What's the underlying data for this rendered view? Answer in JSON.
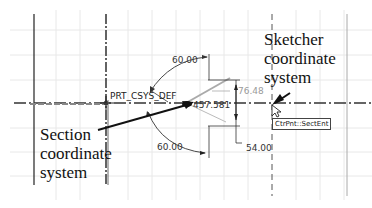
{
  "sketch": {
    "csys_label": "PRT_CSYS_DEF",
    "callouts": {
      "sketcher": [
        "Sketcher",
        "coordinate",
        "system"
      ],
      "section": [
        "Section",
        "coordinate",
        "system"
      ]
    },
    "dimensions": {
      "angle_top": "60.00",
      "angle_bottom": "60.00",
      "horizontal_grey": "76.48",
      "vertical": "54.00",
      "coordinate_readout": "457.581"
    },
    "tooltip": "CtrPnt::SectEnt"
  },
  "colors": {
    "grid": "#e6e6e6",
    "geometry": "#222222",
    "dimension_grey": "#9a9a9a",
    "background": "#ffffff"
  }
}
